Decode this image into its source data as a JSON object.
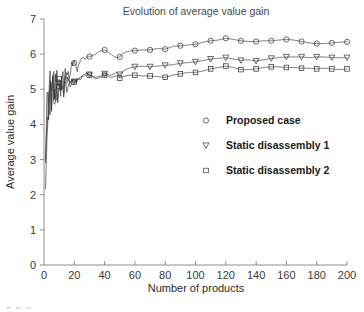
{
  "chart_data": {
    "type": "line",
    "title": "Evolution of average value gain",
    "xlabel": "Number of products",
    "ylabel": "Average value gain",
    "xlim": [
      0,
      200
    ],
    "ylim": [
      0,
      7
    ],
    "xticks": [
      0,
      20,
      40,
      60,
      80,
      100,
      120,
      140,
      160,
      180,
      200
    ],
    "xtick_labels": [
      "0",
      "20",
      "40",
      "60",
      "80",
      "100",
      "120",
      "140",
      "160",
      "180",
      "200"
    ],
    "yticks": [
      0,
      1,
      2,
      3,
      4,
      5,
      6,
      7
    ],
    "ytick_labels": [
      "0",
      "1",
      "2",
      "3",
      "4",
      "5",
      "6",
      "7"
    ],
    "grid": false,
    "legend_position": "center-right-inside",
    "marker_interval": 10,
    "series": [
      {
        "name": "Proposed case",
        "marker": "circle",
        "color": "#3b3b3b",
        "x": [
          1,
          2,
          3,
          4,
          5,
          6,
          7,
          8,
          9,
          10,
          11,
          12,
          13,
          14,
          15,
          16,
          17,
          18,
          19,
          20,
          21,
          22,
          23,
          24,
          25,
          26,
          27,
          28,
          29,
          30,
          32,
          34,
          36,
          38,
          40,
          42,
          44,
          46,
          48,
          50,
          52,
          54,
          56,
          58,
          60,
          65,
          70,
          75,
          80,
          85,
          90,
          95,
          100,
          105,
          110,
          115,
          120,
          125,
          130,
          135,
          140,
          145,
          150,
          155,
          160,
          165,
          170,
          175,
          180,
          185,
          190,
          195,
          200
        ],
        "values": [
          2.8,
          4.55,
          4.3,
          5.05,
          4.72,
          5.28,
          4.95,
          5.35,
          5.08,
          5.3,
          5.12,
          5.42,
          5.18,
          5.5,
          5.3,
          5.58,
          5.42,
          5.62,
          5.7,
          5.75,
          5.62,
          5.55,
          5.7,
          5.82,
          5.88,
          5.92,
          5.86,
          5.9,
          5.94,
          5.93,
          5.96,
          6.0,
          6.06,
          6.1,
          6.12,
          6.06,
          6.0,
          5.94,
          5.9,
          5.92,
          6.02,
          6.06,
          6.08,
          6.1,
          6.1,
          6.12,
          6.12,
          6.16,
          6.14,
          6.22,
          6.24,
          6.26,
          6.28,
          6.34,
          6.38,
          6.4,
          6.45,
          6.42,
          6.38,
          6.36,
          6.36,
          6.38,
          6.38,
          6.4,
          6.42,
          6.4,
          6.36,
          6.32,
          6.3,
          6.3,
          6.32,
          6.34,
          6.35
        ]
      },
      {
        "name": "Static disassembly 1",
        "marker": "triangle-down",
        "color": "#3b3b3b",
        "x": [
          1,
          2,
          3,
          4,
          5,
          6,
          7,
          8,
          9,
          10,
          11,
          12,
          13,
          14,
          15,
          16,
          17,
          18,
          19,
          20,
          21,
          22,
          23,
          24,
          25,
          26,
          27,
          28,
          29,
          30,
          32,
          34,
          36,
          38,
          40,
          42,
          44,
          46,
          48,
          50,
          52,
          54,
          56,
          58,
          60,
          65,
          70,
          75,
          80,
          85,
          90,
          95,
          100,
          105,
          110,
          115,
          120,
          125,
          130,
          135,
          140,
          145,
          150,
          155,
          160,
          165,
          170,
          175,
          180,
          185,
          190,
          195,
          200
        ],
        "values": [
          2.8,
          4.3,
          4.62,
          4.88,
          4.7,
          5.05,
          4.85,
          5.12,
          4.95,
          5.16,
          5.02,
          5.2,
          5.08,
          5.22,
          5.14,
          5.24,
          5.18,
          5.22,
          5.2,
          5.22,
          5.24,
          5.26,
          5.3,
          5.34,
          5.38,
          5.4,
          5.42,
          5.44,
          5.44,
          5.42,
          5.38,
          5.34,
          5.36,
          5.4,
          5.44,
          5.42,
          5.4,
          5.44,
          5.48,
          5.42,
          5.5,
          5.56,
          5.6,
          5.62,
          5.64,
          5.66,
          5.64,
          5.66,
          5.68,
          5.7,
          5.74,
          5.76,
          5.78,
          5.82,
          5.86,
          5.88,
          5.9,
          5.86,
          5.82,
          5.84,
          5.8,
          5.84,
          5.88,
          5.9,
          5.92,
          5.92,
          5.92,
          5.9,
          5.92,
          5.92,
          5.9,
          5.9,
          5.9
        ]
      },
      {
        "name": "Static disassembly 2",
        "marker": "square",
        "color": "#3b3b3b",
        "x": [
          1,
          2,
          3,
          4,
          5,
          6,
          7,
          8,
          9,
          10,
          11,
          12,
          13,
          14,
          15,
          16,
          17,
          18,
          19,
          20,
          21,
          22,
          23,
          24,
          25,
          26,
          27,
          28,
          29,
          30,
          32,
          34,
          36,
          38,
          40,
          42,
          44,
          46,
          48,
          50,
          52,
          54,
          56,
          58,
          60,
          65,
          70,
          75,
          80,
          85,
          90,
          95,
          100,
          105,
          110,
          115,
          120,
          125,
          130,
          135,
          140,
          145,
          150,
          155,
          160,
          165,
          170,
          175,
          180,
          185,
          190,
          195,
          200
        ],
        "values": [
          2.8,
          4.2,
          4.52,
          4.78,
          4.6,
          4.96,
          4.76,
          5.04,
          4.88,
          5.08,
          4.96,
          5.12,
          5.0,
          5.14,
          5.06,
          5.16,
          5.1,
          5.16,
          5.18,
          5.2,
          5.2,
          5.22,
          5.26,
          5.3,
          5.34,
          5.36,
          5.38,
          5.4,
          5.42,
          5.4,
          5.36,
          5.3,
          5.32,
          5.36,
          5.4,
          5.38,
          5.34,
          5.36,
          5.38,
          5.32,
          5.36,
          5.38,
          5.4,
          5.4,
          5.4,
          5.38,
          5.38,
          5.36,
          5.34,
          5.4,
          5.44,
          5.48,
          5.48,
          5.52,
          5.58,
          5.62,
          5.66,
          5.62,
          5.56,
          5.56,
          5.58,
          5.62,
          5.64,
          5.64,
          5.62,
          5.62,
          5.6,
          5.6,
          5.58,
          5.6,
          5.58,
          5.56,
          5.58
        ]
      }
    ]
  },
  "legend": {
    "entries": [
      {
        "label": "Proposed case",
        "marker": "circle"
      },
      {
        "label": "Static disassembly 1",
        "marker": "triangle-down"
      },
      {
        "label": "Static disassembly 2",
        "marker": "square"
      }
    ]
  }
}
